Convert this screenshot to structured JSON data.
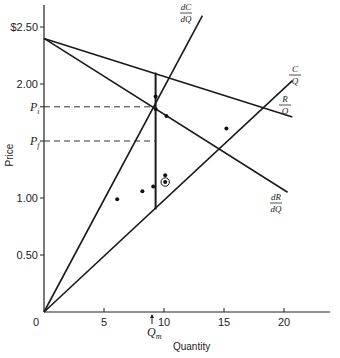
{
  "chart_data": {
    "type": "line",
    "title": "",
    "xlabel": "Quantity",
    "ylabel": "Price",
    "xlim": [
      0,
      24
    ],
    "ylim": [
      0,
      2.7
    ],
    "grid": false,
    "x_ticks": [
      {
        "value": 0,
        "label": "0"
      },
      {
        "value": 5,
        "label": "5"
      },
      {
        "value": 10,
        "label": "10"
      },
      {
        "value": 15,
        "label": "15"
      },
      {
        "value": 20,
        "label": "20"
      }
    ],
    "y_ticks": [
      {
        "value": 0.5,
        "label": "0.50"
      },
      {
        "value": 1.0,
        "label": "1.00"
      },
      {
        "value": 2.0,
        "label": "2.00"
      },
      {
        "value": 2.5,
        "label": "$2.50"
      }
    ],
    "series": [
      {
        "name": "R/Q",
        "label_num": "R",
        "label_den": "Q",
        "points": [
          [
            0,
            2.4
          ],
          [
            20.7,
            1.71
          ]
        ]
      },
      {
        "name": "dR/dQ",
        "label_num": "dR",
        "label_den": "dQ",
        "points": [
          [
            0,
            2.4
          ],
          [
            20.3,
            1.05
          ]
        ]
      },
      {
        "name": "dC/dQ",
        "label_num": "dC",
        "label_den": "dQ",
        "points": [
          [
            0,
            0
          ],
          [
            13.2,
            2.6
          ]
        ]
      },
      {
        "name": "C/Q",
        "label_num": "C",
        "label_den": "Q",
        "points": [
          [
            0,
            0
          ],
          [
            20.7,
            2.03
          ]
        ]
      },
      {
        "name": "vertical",
        "points": [
          [
            9.3,
            2.1
          ],
          [
            9.3,
            0.9
          ]
        ]
      }
    ],
    "scatter_points": [
      {
        "x": 6.1,
        "y": 0.99,
        "circled": false
      },
      {
        "x": 8.2,
        "y": 1.06,
        "circled": false
      },
      {
        "x": 9.1,
        "y": 1.1,
        "circled": false
      },
      {
        "x": 10.1,
        "y": 1.2,
        "circled": false
      },
      {
        "x": 10.1,
        "y": 1.14,
        "circled": true
      },
      {
        "x": 15.2,
        "y": 1.61,
        "circled": false
      },
      {
        "x": 9.3,
        "y": 1.89,
        "circled": false
      },
      {
        "x": 10.2,
        "y": 1.72,
        "circled": false
      },
      {
        "x": 9.3,
        "y": 1.78,
        "circled": false
      }
    ],
    "annotations": [
      {
        "text": "P",
        "sub": "i",
        "y": 1.8,
        "type": "dashed-hline",
        "x_end": 9.3
      },
      {
        "text": "P",
        "sub": "f",
        "y": 1.5,
        "type": "dashed-hline",
        "x_end": 9.3
      },
      {
        "text": "Q",
        "sub": "m",
        "x": 9.0,
        "type": "arrow-marker"
      }
    ]
  }
}
